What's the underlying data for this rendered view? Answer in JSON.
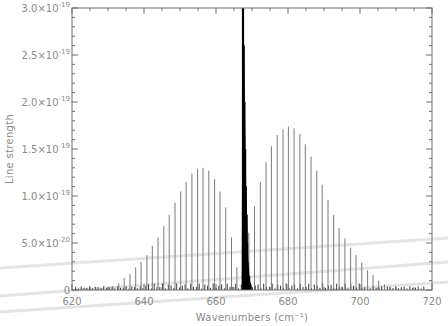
{
  "chart_data": {
    "type": "bar",
    "title": "",
    "xlabel": "Wavenumbers (cm⁻¹)",
    "ylabel": "Line strength",
    "xlim": [
      620,
      720
    ],
    "ylim": [
      0,
      3e-19
    ],
    "grid": false,
    "legend": null,
    "x_ticks": [
      620,
      640,
      660,
      680,
      700,
      720
    ],
    "x_tick_labels": [
      "620",
      "640",
      "660",
      "680",
      "700",
      "720"
    ],
    "y_ticks": [
      0,
      5e-20,
      1e-19,
      1.5e-19,
      2e-19,
      2.5e-19,
      3e-19
    ],
    "y_tick_labels": [
      {
        "mant": "0",
        "exp": ""
      },
      {
        "mant": "5.0×10",
        "exp": "-20"
      },
      {
        "mant": "1.0×10",
        "exp": "-19"
      },
      {
        "mant": "1.5×10",
        "exp": "-19"
      },
      {
        "mant": "2.0×10",
        "exp": "-19"
      },
      {
        "mant": "2.5×10",
        "exp": "-19"
      },
      {
        "mant": "3.0×10",
        "exp": "-19"
      }
    ],
    "series": [
      {
        "name": "P branch",
        "color": "#7a7a7a",
        "x": [
          622.0,
          623.6,
          625.1,
          626.7,
          628.3,
          629.8,
          631.4,
          633.0,
          634.5,
          636.1,
          637.7,
          639.2,
          640.8,
          642.3,
          643.9,
          645.5,
          647.0,
          648.6,
          650.2,
          651.7,
          653.3,
          654.9,
          656.4,
          658.0,
          659.6,
          661.1,
          662.7,
          664.3,
          665.8
        ],
        "values": [
          4e-22,
          6e-22,
          9e-22,
          1.3e-21,
          1.8e-21,
          2.5e-21,
          4e-21,
          7e-21,
          1.3e-20,
          1.7e-20,
          2.4e-20,
          3e-20,
          3.7e-20,
          4.7e-20,
          5.6e-20,
          6.8e-20,
          8e-20,
          9.3e-20,
          1.05e-19,
          1.15e-19,
          1.24e-19,
          1.29e-19,
          1.3e-19,
          1.27e-19,
          1.18e-19,
          1.05e-19,
          8.8e-20,
          5.6e-20,
          2.4e-20
        ]
      },
      {
        "name": "Q branch",
        "color": "#000000",
        "x": [
          667.4,
          667.6,
          667.8,
          668.0,
          668.2,
          668.4,
          668.6,
          668.8,
          669.0,
          669.3,
          669.6,
          670.0
        ],
        "values": [
          3e-19,
          3e-19,
          2.6e-19,
          2e-19,
          1.5e-19,
          1.1e-19,
          8e-20,
          5e-20,
          3e-20,
          1.5e-20,
          7e-21,
          3e-21
        ]
      },
      {
        "name": "R branch",
        "color": "#7a7a7a",
        "x": [
          669.1,
          670.7,
          672.3,
          673.9,
          675.4,
          677.0,
          678.6,
          680.1,
          681.7,
          683.3,
          684.8,
          686.4,
          688.0,
          689.5,
          691.1,
          692.7,
          694.2,
          695.8,
          697.4,
          698.9,
          700.5,
          702.1,
          703.6,
          705.2,
          706.8,
          708.3,
          709.9,
          711.5,
          713.0,
          714.6,
          716.2
        ],
        "values": [
          6.1e-20,
          8.9e-20,
          1.15e-19,
          1.36e-19,
          1.53e-19,
          1.65e-19,
          1.71e-19,
          1.74e-19,
          1.72e-19,
          1.66e-19,
          1.55e-19,
          1.42e-19,
          1.27e-19,
          1.12e-19,
          9.6e-20,
          8e-20,
          6.6e-20,
          5.5e-20,
          4.5e-20,
          3.7e-20,
          2.9e-20,
          2.1e-20,
          1.6e-20,
          1e-20,
          6e-21,
          4e-21,
          2.5e-21,
          1.5e-21,
          1e-21,
          6e-22,
          4e-22
        ]
      }
    ],
    "background_lines": {
      "description": "dense weak hot-band lines along baseline",
      "color": "#3a3a3a"
    },
    "annotations": []
  },
  "layout": {
    "plot_left": 72,
    "plot_right": 432,
    "plot_top": 8,
    "plot_bottom": 290,
    "axis_color": "#6e6e6e",
    "artifact_streak_color": "#e4e4e4"
  }
}
